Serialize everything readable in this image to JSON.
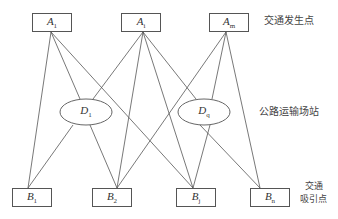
{
  "diagram": {
    "generation_nodes": [
      {
        "id": "A1",
        "base": "A",
        "sub": "1",
        "x": 32,
        "y": 13,
        "w": 40,
        "h": 19
      },
      {
        "id": "Ai",
        "base": "A",
        "sub": "i",
        "x": 121,
        "y": 13,
        "w": 40,
        "h": 19
      },
      {
        "id": "Am",
        "base": "A",
        "sub": "m",
        "x": 209,
        "y": 13,
        "w": 40,
        "h": 19
      }
    ],
    "stations": [
      {
        "id": "D1",
        "base": "D",
        "sub": "1",
        "cx": 86,
        "cy": 112,
        "rx": 26,
        "ry": 13
      },
      {
        "id": "Dq",
        "base": "D",
        "sub": "q",
        "cx": 204,
        "cy": 112,
        "rx": 26,
        "ry": 13
      }
    ],
    "attraction_nodes": [
      {
        "id": "B1",
        "base": "B",
        "sub": "1",
        "x": 12,
        "y": 188,
        "w": 40,
        "h": 19
      },
      {
        "id": "B2",
        "base": "B",
        "sub": "2",
        "x": 92,
        "y": 188,
        "w": 40,
        "h": 19
      },
      {
        "id": "Bj",
        "base": "B",
        "sub": "j",
        "x": 176,
        "y": 188,
        "w": 40,
        "h": 19
      },
      {
        "id": "Bm",
        "base": "B",
        "sub": "n",
        "x": 250,
        "y": 188,
        "w": 40,
        "h": 19
      }
    ],
    "edges": [
      {
        "from": [
          51,
          32
        ],
        "to": [
          28,
          188
        ]
      },
      {
        "from": [
          51,
          32
        ],
        "to": [
          80,
          99
        ]
      },
      {
        "from": [
          51,
          32
        ],
        "to": [
          193,
          188
        ]
      },
      {
        "from": [
          143,
          32
        ],
        "to": [
          93,
          99
        ]
      },
      {
        "from": [
          143,
          32
        ],
        "to": [
          117,
          188
        ]
      },
      {
        "from": [
          143,
          32
        ],
        "to": [
          193,
          188
        ]
      },
      {
        "from": [
          143,
          32
        ],
        "to": [
          196,
          99
        ]
      },
      {
        "from": [
          226,
          32
        ],
        "to": [
          117,
          188
        ]
      },
      {
        "from": [
          226,
          32
        ],
        "to": [
          212,
          99
        ]
      },
      {
        "from": [
          226,
          32
        ],
        "to": [
          260,
          188
        ]
      },
      {
        "from": [
          73,
          125
        ],
        "to": [
          28,
          188
        ]
      },
      {
        "from": [
          90,
          125
        ],
        "to": [
          117,
          188
        ]
      },
      {
        "from": [
          210,
          125
        ],
        "to": [
          193,
          188
        ]
      },
      {
        "from": [
          200,
          125
        ],
        "to": [
          260,
          188
        ]
      }
    ],
    "labels": {
      "generation": "交通发生点",
      "stations": "公路运输场站",
      "attraction_line1": "交通",
      "attraction_line2": "吸引点"
    },
    "colors": {
      "line": "#555555",
      "text": "#333333"
    }
  }
}
